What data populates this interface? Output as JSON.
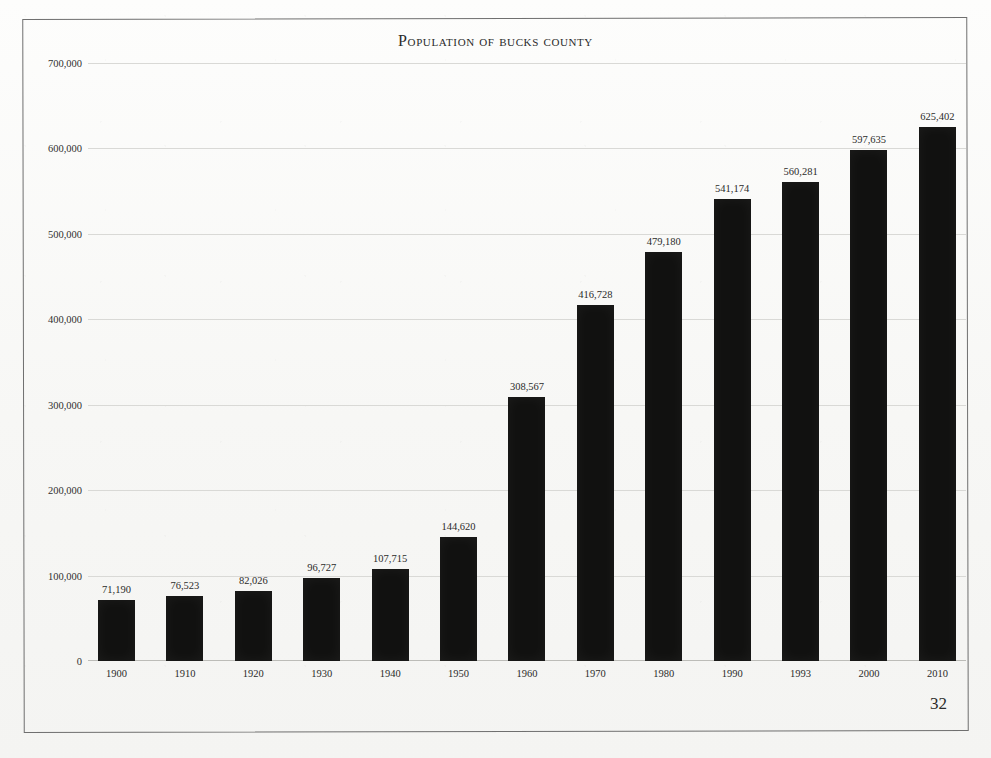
{
  "page": {
    "number": "32"
  },
  "chart_data": {
    "type": "bar",
    "title": "Population of Bucks County",
    "xlabel": "",
    "ylabel": "",
    "ylim": [
      0,
      700000
    ],
    "grid": true,
    "legend": false,
    "categories": [
      "1900",
      "1910",
      "1920",
      "1930",
      "1940",
      "1950",
      "1960",
      "1970",
      "1980",
      "1990",
      "1993",
      "2000",
      "2010"
    ],
    "values": [
      71190,
      76523,
      82026,
      96727,
      107715,
      144620,
      308567,
      416728,
      479180,
      541174,
      560281,
      597635,
      625402
    ],
    "value_labels": [
      "71,190",
      "76,523",
      "82,026",
      "96,727",
      "107,715",
      "144,620",
      "308,567",
      "416,728",
      "479,180",
      "541,174",
      "560,281",
      "597,635",
      "625,402"
    ],
    "y_ticks": [
      0,
      100000,
      200000,
      300000,
      400000,
      500000,
      600000,
      700000
    ],
    "y_tick_labels": [
      "0",
      "100,000",
      "200,000",
      "300,000",
      "400,000",
      "500,000",
      "600,000",
      "700,000"
    ],
    "bar_color": "#111110",
    "grid_color": "#d9d9d6",
    "text_color": "#2b2b2a"
  }
}
